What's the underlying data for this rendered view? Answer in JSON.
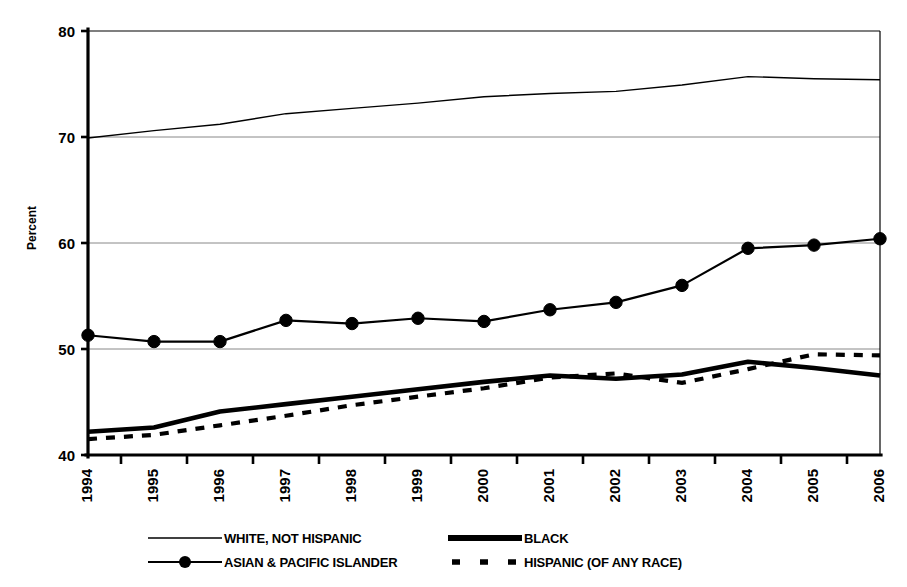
{
  "figure": {
    "ylabel": "Percent",
    "xlabel": "",
    "ghost_title_fragment": ""
  },
  "legend": {
    "entries": [
      {
        "key": "white",
        "label": "WHITE, NOT HISPANIC",
        "style": "thin-line"
      },
      {
        "key": "black",
        "label": "BLACK",
        "style": "thick-line"
      },
      {
        "key": "api",
        "label": "ASIAN & PACIFIC ISLANDER",
        "style": "line-with-circle-marker"
      },
      {
        "key": "hispanic",
        "label": "HISPANIC (OF ANY RACE)",
        "style": "dashed-line"
      }
    ]
  },
  "chart_data": {
    "type": "line",
    "title": "",
    "xlabel": "",
    "ylabel": "Percent",
    "x": [
      1994,
      1995,
      1996,
      1997,
      1998,
      1999,
      2000,
      2001,
      2002,
      2003,
      2004,
      2005,
      2006
    ],
    "categories": [
      "1994",
      "1995",
      "1996",
      "1997",
      "1998",
      "1999",
      "2000",
      "2001",
      "2002",
      "2003",
      "2004",
      "2005",
      "2006"
    ],
    "xlim": [
      1994,
      2006
    ],
    "ylim": [
      40,
      80
    ],
    "yticks": [
      40,
      50,
      60,
      70,
      80
    ],
    "ytick_labels": [
      "40",
      "50",
      "60",
      "70",
      "80"
    ],
    "grid": true,
    "grid_axis": "y",
    "legend_position": "bottom",
    "series": [
      {
        "name": "WHITE, NOT HISPANIC",
        "values": [
          69.9,
          70.6,
          71.2,
          72.2,
          72.7,
          73.2,
          73.8,
          74.1,
          74.3,
          74.9,
          75.7,
          75.5,
          75.4
        ]
      },
      {
        "name": "BLACK",
        "values": [
          42.2,
          42.6,
          44.1,
          44.8,
          45.5,
          46.2,
          46.9,
          47.5,
          47.2,
          47.6,
          48.8,
          48.2,
          47.5
        ]
      },
      {
        "name": "ASIAN & PACIFIC ISLANDER",
        "values": [
          51.3,
          50.7,
          50.7,
          52.7,
          52.4,
          52.9,
          52.6,
          53.7,
          54.4,
          56.0,
          59.5,
          59.8,
          60.4
        ]
      },
      {
        "name": "HISPANIC (OF ANY RACE)",
        "values": [
          41.5,
          41.9,
          42.8,
          43.7,
          44.7,
          45.5,
          46.3,
          47.3,
          47.7,
          46.8,
          48.1,
          49.5,
          49.4
        ]
      }
    ]
  }
}
